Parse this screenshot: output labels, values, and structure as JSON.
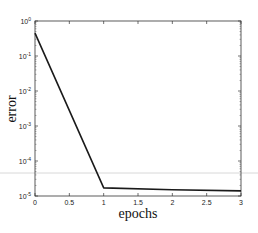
{
  "chart_data": {
    "type": "line",
    "title": "",
    "xlabel": "epochs",
    "ylabel": "error",
    "x": [
      0,
      1,
      2,
      3
    ],
    "series": [
      {
        "name": "error",
        "values": [
          0.45,
          1.7e-05,
          1.5e-05,
          1.4e-05
        ],
        "color": "#1a1a1a"
      }
    ],
    "xlim": [
      0,
      3
    ],
    "ylim": [
      1e-05,
      1
    ],
    "yscale": "log",
    "xticks": [
      0,
      0.5,
      1,
      1.5,
      2,
      2.5,
      3
    ],
    "xtick_labels": [
      "0",
      "0.5",
      "1",
      "1.5",
      "2",
      "2.5",
      "3"
    ],
    "yticks": [
      1,
      0.1,
      0.01,
      0.001,
      0.0001,
      1e-05
    ],
    "ytick_labels": [
      {
        "base": "10",
        "exp": "0"
      },
      {
        "base": "10",
        "exp": "-1"
      },
      {
        "base": "10",
        "exp": "-2"
      },
      {
        "base": "10",
        "exp": "-3"
      },
      {
        "base": "10",
        "exp": "-4"
      },
      {
        "base": "10",
        "exp": "-5"
      }
    ],
    "grid": false,
    "legend": null
  },
  "layout": {
    "plot_left": 35,
    "plot_top": 21,
    "plot_right": 241,
    "plot_bottom": 196,
    "artifact_line_y": 173
  }
}
